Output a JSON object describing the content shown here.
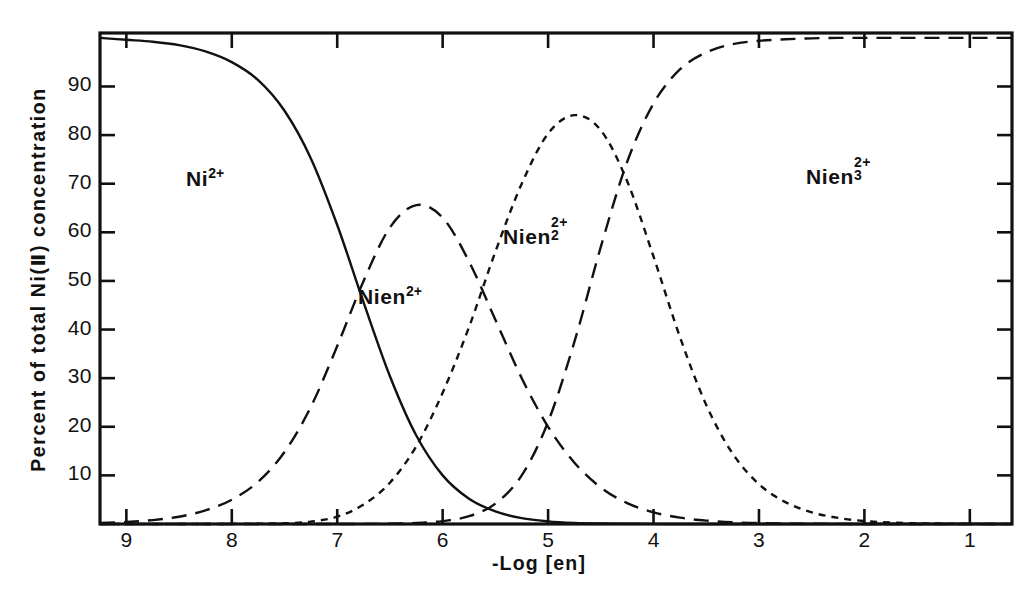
{
  "chart_data": {
    "type": "line",
    "title": "",
    "xlabel": "-Log [en]",
    "ylabel": "Percent of total Ni(II) concentration",
    "xlim": [
      9.25,
      0.6
    ],
    "ylim": [
      0,
      101
    ],
    "x_ticks": [
      9,
      8,
      7,
      6,
      5,
      4,
      3,
      2,
      1
    ],
    "x_tick_labels": [
      "9",
      "8",
      "7",
      "6",
      "5",
      "4",
      "3",
      "2",
      "1"
    ],
    "y_ticks": [
      10,
      20,
      30,
      40,
      50,
      60,
      70,
      80,
      90
    ],
    "y_tick_labels": [
      "10",
      "20",
      "30",
      "40",
      "50",
      "60",
      "70",
      "80",
      "90"
    ],
    "grid": false,
    "legend": "inline-annotations",
    "x": [
      9.25,
      9.0,
      8.75,
      8.5,
      8.25,
      8.0,
      7.75,
      7.5,
      7.25,
      7.0,
      6.75,
      6.5,
      6.25,
      6.0,
      5.75,
      5.5,
      5.25,
      5.0,
      4.75,
      4.5,
      4.25,
      4.0,
      3.75,
      3.5,
      3.25,
      3.0,
      2.75,
      2.5,
      2.25,
      2.0,
      1.75,
      1.5,
      1.25,
      1.0,
      0.75,
      0.6
    ],
    "series": [
      {
        "name": "Ni2+",
        "label": "Ni^2+",
        "linestyle": "solid",
        "values": [
          100,
          99.6,
          99.2,
          98.5,
          97.2,
          95.0,
          91.3,
          85.0,
          75.2,
          61.5,
          45.6,
          30.4,
          18.2,
          10.0,
          5.2,
          2.6,
          1.2,
          0.55,
          0.24,
          0.1,
          0.04,
          0.016,
          0.006,
          0.002,
          0.001,
          0,
          0,
          0,
          0,
          0,
          0,
          0,
          0,
          0,
          0,
          0
        ]
      },
      {
        "name": "Nien2+",
        "label": "Nien^2+",
        "linestyle": "long-dash",
        "values": [
          0.2,
          0.4,
          0.8,
          1.5,
          2.8,
          5.0,
          8.7,
          14.8,
          24.1,
          36.6,
          50.0,
          61.0,
          65.6,
          63.0,
          54.0,
          42.0,
          30.0,
          20.0,
          12.6,
          7.5,
          4.3,
          2.4,
          1.3,
          0.7,
          0.35,
          0.18,
          0.09,
          0.04,
          0.02,
          0.01,
          0,
          0,
          0,
          0,
          0,
          0
        ]
      },
      {
        "name": "Nien2_2+",
        "label": "Nien_2^2+",
        "linestyle": "short-dash",
        "values": [
          0,
          0,
          0,
          0,
          0,
          0.02,
          0.05,
          0.15,
          0.5,
          1.5,
          4.0,
          8.5,
          16.0,
          27.0,
          40.5,
          56.0,
          70.0,
          80.3,
          84.1,
          81.0,
          70.5,
          55.0,
          38.5,
          24.5,
          14.5,
          8.2,
          4.5,
          2.4,
          1.25,
          0.6,
          0.3,
          0.15,
          0.07,
          0.03,
          0.01,
          0
        ]
      },
      {
        "name": "Nien3_2+",
        "label": "Nien_3^2+",
        "linestyle": "long-dash",
        "values": [
          0,
          0,
          0,
          0,
          0,
          0,
          0,
          0,
          0,
          0,
          0.02,
          0.06,
          0.2,
          0.6,
          1.6,
          4.2,
          10.0,
          21.0,
          37.5,
          57.0,
          74.5,
          86.5,
          93.5,
          97.0,
          98.7,
          99.4,
          99.7,
          99.9,
          100,
          100,
          100,
          100,
          100,
          100,
          100,
          100
        ]
      }
    ],
    "annotations": [
      {
        "text": "Ni",
        "sup": "2+",
        "sub": "",
        "x_px": 186,
        "y_px": 165
      },
      {
        "text": "Nien",
        "sup": "2+",
        "sub": "",
        "x_px": 358,
        "y_px": 283
      },
      {
        "text": "Nien",
        "sup": "2+",
        "sub": "2",
        "x_px": 503,
        "y_px": 223
      },
      {
        "text": "Nien",
        "sup": "2+",
        "sub": "3",
        "x_px": 806,
        "y_px": 163
      }
    ]
  },
  "axis": {
    "y_title": "Percent of total Ni(Ⅱ) concentration",
    "x_title": "-Log [en]"
  }
}
